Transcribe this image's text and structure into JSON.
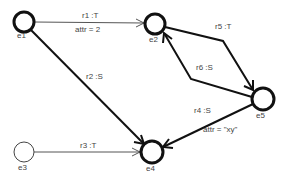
{
  "diagram": {
    "type": "graph",
    "nodes": [
      {
        "id": "e1",
        "label": "e1",
        "x": 24,
        "y": 22,
        "r": 10,
        "stroke": 3,
        "lx": 17,
        "ly": 35
      },
      {
        "id": "e2",
        "label": "e2",
        "x": 155,
        "y": 24,
        "r": 10,
        "stroke": 3,
        "lx": 150,
        "ly": 38
      },
      {
        "id": "e3",
        "label": "e3",
        "x": 24,
        "y": 152,
        "r": 10,
        "stroke": 1,
        "lx": 19,
        "ly": 166
      },
      {
        "id": "e4",
        "label": "e4",
        "x": 152,
        "y": 152,
        "r": 11,
        "stroke": 3,
        "lx": 146,
        "ly": 167
      },
      {
        "id": "e5",
        "label": "e5",
        "x": 263,
        "y": 99,
        "r": 11,
        "stroke": 3,
        "lx": 256,
        "ly": 114
      }
    ],
    "edges": [
      {
        "id": "r1",
        "label": "r1 :T",
        "attr": "attr = 2",
        "from": "e1",
        "to": "e2",
        "style": "thin"
      },
      {
        "id": "r2",
        "label": "r2 :S",
        "from": "e1",
        "to": "e4",
        "style": "thick"
      },
      {
        "id": "r3",
        "label": "r3 :T",
        "from": "e3",
        "to": "e4",
        "style": "thin"
      },
      {
        "id": "r4",
        "label": "r4 :S",
        "attr": "attr = \"xy\"",
        "from": "e5",
        "to": "e4",
        "style": "thick"
      },
      {
        "id": "r5",
        "label": "r5 :T",
        "from": "e2",
        "to": "e5",
        "style": "thick"
      },
      {
        "id": "r6",
        "label": "r6 :S",
        "from": "e5",
        "to": "e2",
        "style": "thick"
      }
    ]
  },
  "labels": {
    "e1": "e1",
    "e2": "e2",
    "e3": "e3",
    "e4": "e4",
    "e5": "e5",
    "r1": "r1 :T",
    "r1_attr": "attr = 2",
    "r2": "r2 :S",
    "r3": "r3 :T",
    "r4": "r4 :S",
    "r4_attr": "attr = \"xy\"",
    "r5": "r5 :T",
    "r6": "r6 :S"
  },
  "colors": {
    "stroke": "#111111",
    "thin_stroke": "#555555",
    "text": "#444444",
    "background": "#ffffff"
  }
}
